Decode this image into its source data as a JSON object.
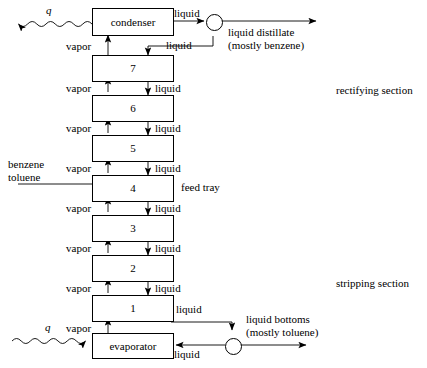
{
  "diagram": {
    "units": [
      {
        "id": "condenser",
        "label": "condenser"
      },
      {
        "id": "tray-7",
        "label": "7"
      },
      {
        "id": "tray-6",
        "label": "6"
      },
      {
        "id": "tray-5",
        "label": "5"
      },
      {
        "id": "tray-4",
        "label": "4"
      },
      {
        "id": "tray-3",
        "label": "3"
      },
      {
        "id": "tray-2",
        "label": "2"
      },
      {
        "id": "tray-1",
        "label": "1"
      },
      {
        "id": "evaporator",
        "label": "evaporator"
      }
    ],
    "heat": {
      "top_label": "q",
      "bottom_label": "q"
    },
    "feed": {
      "line1": "benzene",
      "line2": "toluene",
      "tray_note": "feed tray"
    },
    "streams": {
      "vapor": "vapor",
      "liquid": "liquid"
    },
    "vapor_labels": [
      "vapor",
      "vapor",
      "vapor",
      "vapor",
      "vapor",
      "vapor",
      "vapor",
      "vapor"
    ],
    "liquid_labels": [
      "liquid",
      "liquid",
      "liquid",
      "liquid",
      "liquid",
      "liquid",
      "liquid"
    ],
    "products": {
      "distillate_stream": "liquid",
      "distillate_reflux": "liquid",
      "distillate_line1": "liquid distillate",
      "distillate_line2": "(mostly benzene)",
      "bottoms_stream": "liquid",
      "bottoms_return": "liquid",
      "bottoms_line1": "liquid bottoms",
      "bottoms_line2": "(mostly toluene)"
    },
    "sections": {
      "rectifying": "rectifying section",
      "stripping": "stripping section"
    },
    "colors": {
      "line": "#000000",
      "background": "#ffffff"
    }
  }
}
